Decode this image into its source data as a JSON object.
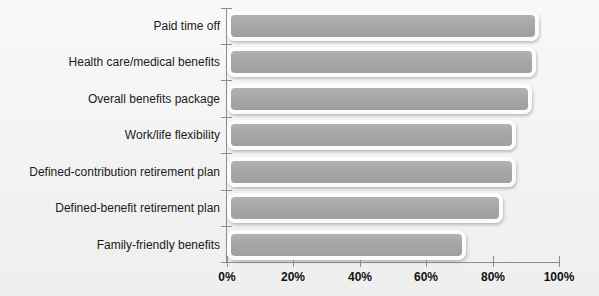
{
  "chart_data": {
    "type": "bar",
    "orientation": "horizontal",
    "title": "",
    "xlabel": "",
    "ylabel": "",
    "xlim": [
      0,
      100
    ],
    "grid": false,
    "legend": false,
    "value_suffix": "%",
    "categories": [
      "Paid time off",
      "Health care/medical benefits",
      "Overall benefits package",
      "Work/life flexibility",
      "Defined-contribution retirement plan",
      "Defined-benefit retirement plan",
      "Family-friendly benefits"
    ],
    "values": [
      94,
      93,
      92,
      87,
      87,
      83,
      72
    ],
    "xticks": [
      0,
      20,
      40,
      60,
      80,
      100
    ],
    "xticklabels": [
      "0%",
      "20%",
      "40%",
      "60%",
      "80%",
      "100%"
    ],
    "colors": {
      "background": "#f0f0f0",
      "bar_fill": "#a6a6a6",
      "bar_outline": "#fcfcfc",
      "axis": "#8d8d8d",
      "text": "#1b1b1b"
    }
  }
}
